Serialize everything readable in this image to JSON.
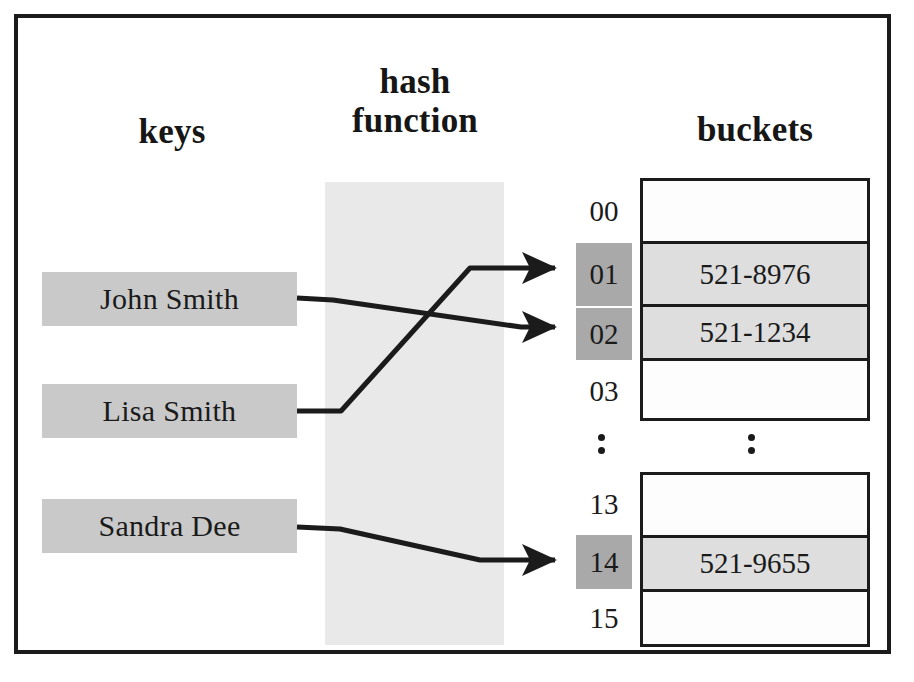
{
  "diagram": {
    "headings": {
      "keys": "keys",
      "hash_function": "hash\nfunction",
      "buckets": "buckets"
    },
    "colors": {
      "key_box_fill": "#c9c9c9",
      "hash_band_fill": "#e9e9e9",
      "index_highlight_fill": "#a9a9a9",
      "bucket_filled_fill": "#dedede",
      "bucket_empty_fill": "#fdfdfd",
      "stroke": "#1b1b1b",
      "text": "#1a1a1a",
      "frame": "#1b1b1b"
    },
    "keys": [
      {
        "label": "John Smith",
        "maps_to_index": "02"
      },
      {
        "label": "Lisa Smith",
        "maps_to_index": "01"
      },
      {
        "label": "Sandra Dee",
        "maps_to_index": "14"
      }
    ],
    "indices_top": [
      {
        "label": "00",
        "highlighted": false
      },
      {
        "label": "01",
        "highlighted": true
      },
      {
        "label": "02",
        "highlighted": true
      },
      {
        "label": "03",
        "highlighted": false
      }
    ],
    "indices_bottom": [
      {
        "label": "13",
        "highlighted": false
      },
      {
        "label": "14",
        "highlighted": true
      },
      {
        "label": "15",
        "highlighted": false
      }
    ],
    "buckets_top": [
      {
        "value": "",
        "filled": false
      },
      {
        "value": "521-8976",
        "filled": true
      },
      {
        "value": "521-1234",
        "filled": true
      },
      {
        "value": "",
        "filled": false
      }
    ],
    "buckets_bottom": [
      {
        "value": "",
        "filled": false
      },
      {
        "value": "521-9655",
        "filled": true
      },
      {
        "value": "",
        "filled": false
      }
    ],
    "ellipsis": {
      "index_column": "⋮",
      "bucket_column": "⋮"
    },
    "arrows": [
      {
        "from": "John Smith",
        "to": "02"
      },
      {
        "from": "Lisa Smith",
        "to": "01"
      },
      {
        "from": "Sandra Dee",
        "to": "14"
      }
    ]
  }
}
